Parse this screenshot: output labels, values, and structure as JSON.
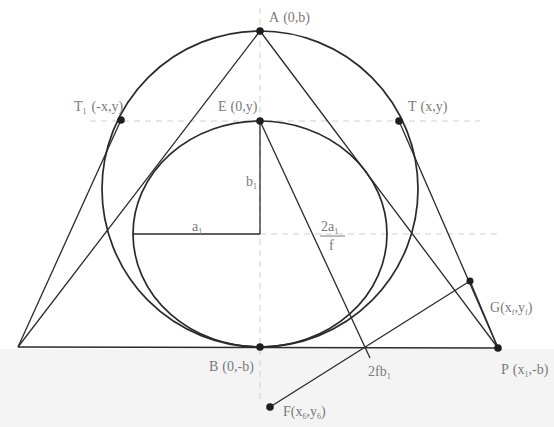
{
  "figure": {
    "colors": {
      "stroke": "#2a2a2a",
      "label": "#7a7a7a",
      "axis_dash": "#cfcfcf",
      "point": "#1e1e1e"
    }
  },
  "points": {
    "A": {
      "name": "A",
      "coords": "(0,b)"
    },
    "E": {
      "name": "E",
      "coords": "(0,y)"
    },
    "T1": {
      "name": "T",
      "sub": "1",
      "coords": "(-x,y)"
    },
    "T": {
      "name": "T",
      "coords": "(x,y)"
    },
    "B": {
      "name": "B",
      "coords": "(0,-b)"
    },
    "P": {
      "name": "P",
      "coords_pre": "(x",
      "coords_sub": "1",
      "coords_post": ",-b)"
    },
    "G": {
      "name": "G",
      "coords_pre": "(x",
      "coords_sub1": "f",
      "coords_mid": ",y",
      "coords_sub2": "f",
      "coords_post": ")"
    },
    "F": {
      "name": "F",
      "coords_pre": "(x",
      "coords_sub1": "6",
      "coords_mid": ",y",
      "coords_sub2": "6",
      "coords_post": ")"
    }
  },
  "segments": {
    "a1": {
      "base": "a",
      "sub": "1"
    },
    "b1": {
      "base": "b",
      "sub": "1"
    },
    "frac": {
      "numerator_base": "2a",
      "numerator_sub": "1",
      "denominator": "f"
    },
    "fb": {
      "base": "2fb",
      "sub": "1"
    }
  }
}
